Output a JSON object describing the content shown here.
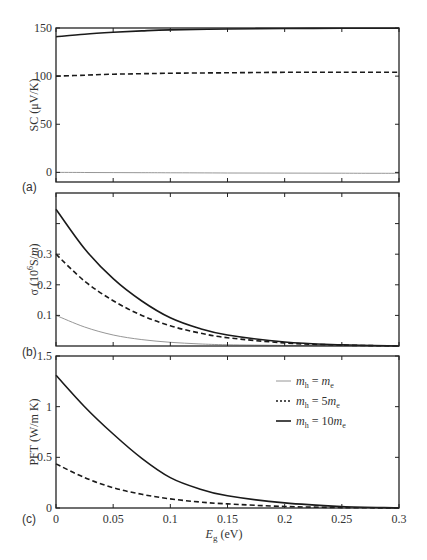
{
  "figure": {
    "xlabel_main": "E",
    "xlabel_sub": "g",
    "xlabel_unit": " (eV)",
    "x_ticks": [
      "0",
      "0.05",
      "0.1",
      "0.15",
      "0.2",
      "0.25",
      "0.3"
    ],
    "legend": [
      {
        "style": "thin-gray-solid",
        "prefix": "m",
        "sub": "h",
        "rhs": " = m",
        "rhs_sub": "e",
        "label": "m_h = m_e"
      },
      {
        "style": "dashed",
        "prefix": "m",
        "sub": "h",
        "rhs": " = 5m",
        "rhs_sub": "e",
        "label": "m_h = 5m_e"
      },
      {
        "style": "thick-solid",
        "prefix": "m",
        "sub": "h",
        "rhs": " = 10m",
        "rhs_sub": "e",
        "label": "m_h = 10m_e"
      }
    ],
    "colors": {
      "axis": "#222222",
      "thick": "#1a1a1a",
      "dashed": "#1a1a1a",
      "thin": "#8a8a8a"
    }
  },
  "chart_data": [
    {
      "panel": "(a)",
      "type": "line",
      "title": "",
      "xlabel": "",
      "ylabel": "SC (μV/K)",
      "xlim": [
        0,
        0.3
      ],
      "ylim": [
        -10,
        150
      ],
      "y_ticks": [
        "0",
        "50",
        "100",
        "150"
      ],
      "x": [
        0,
        0.025,
        0.05,
        0.075,
        0.1,
        0.15,
        0.2,
        0.25,
        0.3
      ],
      "series": [
        {
          "name": "m_h = m_e",
          "values": [
            0,
            -0.1,
            -0.2,
            -0.3,
            -0.4,
            -0.6,
            -0.8,
            -0.9,
            -1.0
          ]
        },
        {
          "name": "m_h = 5m_e",
          "values": [
            100,
            101,
            102,
            102.5,
            103,
            103.5,
            104,
            104,
            104
          ]
        },
        {
          "name": "m_h = 10m_e",
          "values": [
            141,
            143.5,
            145.5,
            147,
            148,
            149,
            149.5,
            149.7,
            149.8
          ]
        }
      ],
      "grid": false,
      "legend_position": "none"
    },
    {
      "panel": "(b)",
      "type": "line",
      "title": "",
      "xlabel": "",
      "ylabel": "σ (10^6 S/m)",
      "xlim": [
        0,
        0.3
      ],
      "ylim": [
        0,
        0.5
      ],
      "y_ticks": [
        "0.1",
        "0.2",
        "0.3"
      ],
      "x": [
        0,
        0.025,
        0.05,
        0.075,
        0.1,
        0.125,
        0.15,
        0.2,
        0.25,
        0.3
      ],
      "series": [
        {
          "name": "m_h = m_e",
          "values": [
            0.1,
            0.062,
            0.036,
            0.021,
            0.012,
            0.007,
            0.004,
            0.002,
            0.001,
            0.0
          ]
        },
        {
          "name": "m_h = 5m_e",
          "values": [
            0.3,
            0.212,
            0.148,
            0.1,
            0.066,
            0.043,
            0.027,
            0.01,
            0.003,
            0.0
          ]
        },
        {
          "name": "m_h = 10m_e",
          "values": [
            0.447,
            0.318,
            0.22,
            0.147,
            0.092,
            0.058,
            0.036,
            0.013,
            0.004,
            0.0
          ]
        }
      ],
      "grid": false,
      "legend_position": "none"
    },
    {
      "panel": "(c)",
      "type": "line",
      "title": "",
      "xlabel": "Eg (eV)",
      "ylabel": "PFT (W/m K)",
      "xlim": [
        0,
        0.3
      ],
      "ylim": [
        0,
        1.5
      ],
      "y_ticks": [
        "0",
        "0.5",
        "1",
        "1.5"
      ],
      "x": [
        0,
        0.025,
        0.05,
        0.075,
        0.1,
        0.125,
        0.15,
        0.2,
        0.25,
        0.3
      ],
      "series": [
        {
          "name": "m_h = m_e",
          "values": [
            0.0,
            0.0,
            0.0,
            0.0,
            0.0,
            0.0,
            0.0,
            0.0,
            0.0,
            0.0
          ]
        },
        {
          "name": "m_h = 5m_e",
          "values": [
            0.435,
            0.3,
            0.2,
            0.135,
            0.09,
            0.06,
            0.04,
            0.015,
            0.004,
            0.0
          ]
        },
        {
          "name": "m_h = 10m_e",
          "values": [
            1.31,
            1.0,
            0.73,
            0.49,
            0.3,
            0.19,
            0.12,
            0.05,
            0.015,
            0.0
          ]
        }
      ],
      "grid": false,
      "legend_position": "upper right"
    }
  ]
}
